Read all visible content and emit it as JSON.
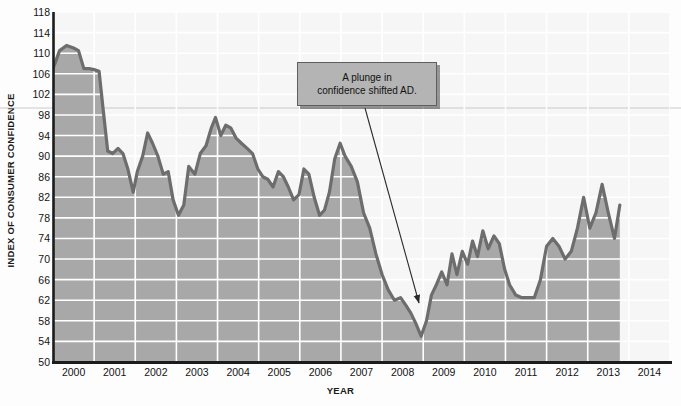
{
  "chart_data": {
    "type": "area",
    "title": "",
    "xlabel": "YEAR",
    "ylabel": "INDEX OF CONSUMER CONFIDENCE",
    "ylim": [
      50,
      118
    ],
    "xlim": [
      2000,
      2014
    ],
    "grid": true,
    "legend": null,
    "y_ticks": [
      50,
      54,
      58,
      62,
      66,
      70,
      74,
      78,
      82,
      86,
      90,
      94,
      98,
      102,
      106,
      110,
      114,
      118
    ],
    "x_ticks": [
      2000,
      2001,
      2002,
      2003,
      2004,
      2005,
      2006,
      2007,
      2008,
      2009,
      2010,
      2011,
      2012,
      2013,
      2014
    ],
    "series": [
      {
        "name": "Index of Consumer Confidence",
        "x": [
          2000.0,
          2000.16,
          2000.33,
          2000.5,
          2000.62,
          2000.75,
          2000.88,
          2001.0,
          2001.12,
          2001.22,
          2001.33,
          2001.45,
          2001.58,
          2001.7,
          2001.82,
          2001.95,
          2002.05,
          2002.18,
          2002.3,
          2002.42,
          2002.55,
          2002.68,
          2002.8,
          2002.92,
          2003.05,
          2003.18,
          2003.3,
          2003.45,
          2003.58,
          2003.72,
          2003.85,
          2003.95,
          2004.08,
          2004.2,
          2004.32,
          2004.45,
          2004.58,
          2004.72,
          2004.85,
          2004.98,
          2005.1,
          2005.22,
          2005.35,
          2005.48,
          2005.6,
          2005.72,
          2005.85,
          2005.98,
          2006.1,
          2006.22,
          2006.35,
          2006.48,
          2006.6,
          2006.72,
          2006.85,
          2006.98,
          2007.1,
          2007.25,
          2007.4,
          2007.55,
          2007.7,
          2007.85,
          2008.0,
          2008.15,
          2008.3,
          2008.45,
          2008.58,
          2008.7,
          2008.82,
          2008.95,
          2009.08,
          2009.2,
          2009.32,
          2009.45,
          2009.58,
          2009.7,
          2009.82,
          2009.95,
          2010.08,
          2010.2,
          2010.32,
          2010.45,
          2010.58,
          2010.72,
          2010.85,
          2010.98,
          2011.1,
          2011.25,
          2011.4,
          2011.55,
          2011.7,
          2011.85,
          2012.0,
          2012.15,
          2012.3,
          2012.45,
          2012.6,
          2012.75,
          2012.9,
          2013.05,
          2013.2,
          2013.35,
          2013.5,
          2013.65,
          2013.78
        ],
        "values": [
          107.0,
          110.5,
          111.5,
          111.0,
          110.5,
          107.0,
          107.0,
          106.8,
          106.5,
          99.0,
          91.0,
          90.5,
          91.5,
          90.5,
          87.5,
          83.0,
          87.0,
          90.0,
          94.5,
          92.5,
          90.0,
          86.5,
          87.0,
          81.5,
          78.5,
          80.5,
          88.0,
          86.5,
          90.5,
          92.0,
          95.5,
          97.5,
          94.0,
          96.0,
          95.5,
          93.5,
          92.5,
          91.5,
          90.5,
          87.5,
          86.0,
          85.5,
          84.0,
          87.0,
          86.0,
          84.0,
          81.5,
          82.5,
          87.5,
          86.5,
          82.0,
          78.5,
          79.5,
          83.0,
          89.5,
          92.5,
          90.0,
          88.0,
          85.0,
          79.0,
          76.0,
          71.0,
          67.0,
          64.0,
          62.0,
          62.5,
          61.0,
          59.5,
          57.5,
          55.0,
          58.0,
          63.0,
          65.0,
          67.5,
          65.0,
          71.0,
          67.0,
          71.5,
          69.0,
          73.5,
          70.5,
          75.5,
          72.0,
          74.5,
          73.0,
          68.0,
          65.0,
          63.0,
          62.5,
          62.5,
          62.5,
          66.0,
          72.5,
          74.0,
          72.5,
          70.0,
          71.5,
          76.0,
          82.0,
          76.0,
          79.0,
          84.5,
          79.0,
          74.0,
          80.5
        ]
      }
    ],
    "annotations": [
      {
        "text": "A plunge in confidence shifted AD.",
        "line1": "A plunge in",
        "line2": "confidence shifted AD.",
        "points_to_year": 2008.9,
        "points_to_value": 56
      }
    ],
    "colors": {
      "fill": "#a8a8a8",
      "line": "#6d6d6d",
      "gridline": "#ffffff",
      "axis": "#1c1c1c",
      "plot_background": "#f6f6f6",
      "annotation_fill": "#b4b4b4",
      "annotation_border": "#5e5e5e",
      "arrow": "#2a2a2a",
      "text": "#141414"
    }
  }
}
